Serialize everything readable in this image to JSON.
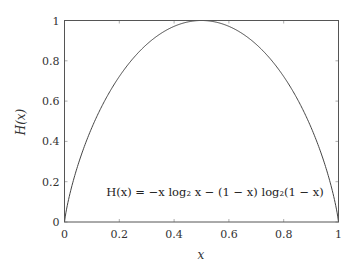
{
  "chart_data": {
    "type": "line",
    "title": "",
    "xlabel": "x",
    "ylabel": "H(x)",
    "xlim": [
      0,
      1
    ],
    "ylim": [
      0,
      1
    ],
    "grid": false,
    "legend": null,
    "x_ticks": [
      "0",
      "0.2",
      "0.4",
      "0.6",
      "0.8",
      "1"
    ],
    "y_ticks": [
      "0",
      "0.2",
      "0.4",
      "0.6",
      "0.8",
      "1"
    ],
    "annotation": "H(x) = −x log₂ x − (1 − x) log₂(1 − x)",
    "series": [
      {
        "name": "H(x)",
        "function": "-x*log2(x)-(1-x)*log2(1-x)",
        "x": [
          0,
          0.05,
          0.1,
          0.15,
          0.2,
          0.25,
          0.3,
          0.35,
          0.4,
          0.45,
          0.5,
          0.55,
          0.6,
          0.65,
          0.7,
          0.75,
          0.8,
          0.85,
          0.9,
          0.95,
          1
        ],
        "values": [
          0,
          0.286,
          0.469,
          0.61,
          0.722,
          0.811,
          0.881,
          0.934,
          0.971,
          0.993,
          1.0,
          0.993,
          0.971,
          0.934,
          0.881,
          0.811,
          0.722,
          0.61,
          0.469,
          0.286,
          0
        ]
      }
    ]
  },
  "labels": {
    "xlabel": "x",
    "ylabel": "H(x)",
    "formula": "H(x) = −x log₂ x − (1 − x) log₂(1 − x)"
  },
  "colors": {
    "frame": "#555555",
    "curve": "#444444",
    "text": "#333333"
  }
}
